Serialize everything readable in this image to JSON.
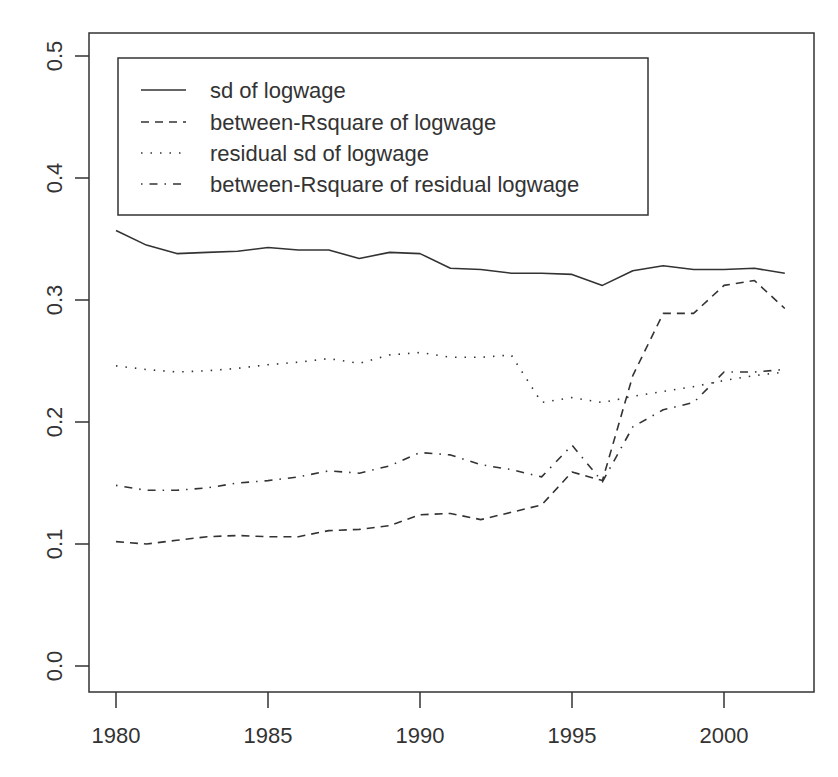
{
  "chart_data": {
    "type": "line",
    "title": "",
    "xlabel": "",
    "ylabel": "",
    "xlim": [
      1979.2,
      2002.9
    ],
    "ylim": [
      -0.02,
      0.52
    ],
    "grid": false,
    "legend_position": "top-left (inside plot)",
    "x_ticks": [
      1980,
      1985,
      1990,
      1995,
      2000
    ],
    "y_ticks": [
      0.0,
      0.1,
      0.2,
      0.3,
      0.4,
      0.5
    ],
    "x_tick_labels": [
      "1980",
      "1985",
      "1990",
      "1995",
      "2000"
    ],
    "y_tick_labels": [
      "0.0",
      "0.1",
      "0.2",
      "0.3",
      "0.4",
      "0.5"
    ],
    "x": [
      1980,
      1981,
      1982,
      1983,
      1984,
      1985,
      1986,
      1987,
      1988,
      1989,
      1990,
      1991,
      1992,
      1993,
      1994,
      1995,
      1996,
      1997,
      1998,
      1999,
      2000,
      2001,
      2002
    ],
    "series": [
      {
        "name": "sd of logwage",
        "style": "solid",
        "values": [
          0.357,
          0.345,
          0.338,
          0.339,
          0.34,
          0.343,
          0.341,
          0.341,
          0.334,
          0.339,
          0.338,
          0.326,
          0.325,
          0.322,
          0.322,
          0.321,
          0.312,
          0.324,
          0.328,
          0.325,
          0.325,
          0.326,
          0.322
        ]
      },
      {
        "name": "between-Rsquare of logwage",
        "style": "dashed",
        "values": [
          0.102,
          0.1,
          0.103,
          0.106,
          0.107,
          0.106,
          0.106,
          0.111,
          0.112,
          0.115,
          0.124,
          0.125,
          0.12,
          0.126,
          0.132,
          0.159,
          0.152,
          0.238,
          0.289,
          0.289,
          0.312,
          0.316,
          0.293
        ]
      },
      {
        "name": "residual sd of logwage",
        "style": "dotted",
        "values": [
          0.246,
          0.243,
          0.241,
          0.242,
          0.244,
          0.247,
          0.249,
          0.252,
          0.248,
          0.255,
          0.257,
          0.253,
          0.253,
          0.255,
          0.216,
          0.22,
          0.216,
          0.221,
          0.225,
          0.229,
          0.234,
          0.238,
          0.241
        ]
      },
      {
        "name": "between-Rsquare of residual logwage",
        "style": "dotdash",
        "values": [
          0.148,
          0.144,
          0.144,
          0.146,
          0.15,
          0.152,
          0.155,
          0.16,
          0.158,
          0.164,
          0.175,
          0.173,
          0.165,
          0.161,
          0.155,
          0.181,
          0.151,
          0.196,
          0.21,
          0.216,
          0.241,
          0.241,
          0.243
        ]
      }
    ]
  },
  "legend": {
    "items": [
      "sd of logwage",
      "between-Rsquare of logwage",
      "residual sd of logwage",
      "between-Rsquare of residual logwage"
    ]
  },
  "colors": {
    "line": "#333333",
    "axis": "#333333",
    "background": "#ffffff"
  }
}
